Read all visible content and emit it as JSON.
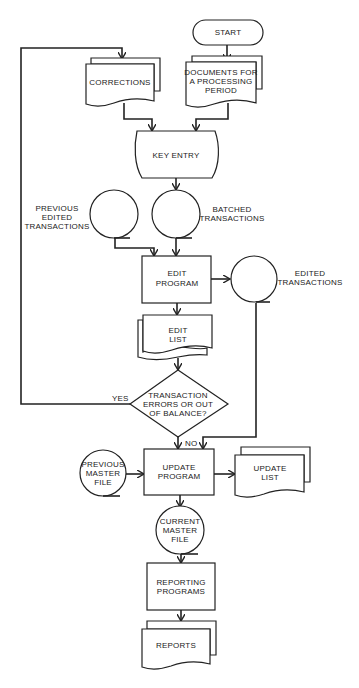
{
  "diagram": {
    "type": "flowchart",
    "colors": {
      "line": "#222222",
      "background": "#ffffff"
    },
    "nodes": {
      "start": {
        "shape": "terminator",
        "lines": [
          "START"
        ]
      },
      "documents": {
        "shape": "multi-document",
        "lines": [
          "DOCUMENTS FOR",
          "A PROCESSING",
          "PERIOD"
        ]
      },
      "corrections": {
        "shape": "multi-document",
        "lines": [
          "CORRECTIONS"
        ]
      },
      "key_entry": {
        "shape": "manual-operation",
        "lines": [
          "KEY ENTRY"
        ]
      },
      "previous_edited": {
        "shape": "magnetic-tape",
        "lines": [
          "PREVIOUS",
          "EDITED",
          "TRANSACTIONS"
        ]
      },
      "batched": {
        "shape": "magnetic-tape",
        "lines": [
          "BATCHED",
          "TRANSACTIONS"
        ]
      },
      "edit_program": {
        "shape": "process",
        "lines": [
          "EDIT",
          "PROGRAM"
        ]
      },
      "edited": {
        "shape": "magnetic-tape",
        "lines": [
          "EDITED",
          "TRANSACTIONS"
        ]
      },
      "edit_list": {
        "shape": "multi-document",
        "lines": [
          "EDIT",
          "LIST"
        ]
      },
      "decision": {
        "shape": "decision",
        "lines": [
          "TRANSACTION",
          "ERRORS OR OUT",
          "OF BALANCE?"
        ]
      },
      "previous_master": {
        "shape": "magnetic-tape",
        "lines": [
          "PREVIOUS",
          "MASTER",
          "FILE"
        ]
      },
      "update_program": {
        "shape": "process",
        "lines": [
          "UPDATE",
          "PROGRAM"
        ]
      },
      "update_list": {
        "shape": "multi-document",
        "lines": [
          "UPDATE",
          "LIST"
        ]
      },
      "current_master": {
        "shape": "magnetic-tape",
        "lines": [
          "CURRENT",
          "MASTER",
          "FILE"
        ]
      },
      "reporting_programs": {
        "shape": "process",
        "lines": [
          "REPORTING",
          "PROGRAMS"
        ]
      },
      "reports": {
        "shape": "multi-document",
        "lines": [
          "REPORTS"
        ]
      }
    },
    "edge_labels": {
      "yes": "YES",
      "no": "NO"
    },
    "edges": [
      [
        "start",
        "documents"
      ],
      [
        "documents",
        "key_entry"
      ],
      [
        "corrections",
        "key_entry"
      ],
      [
        "key_entry",
        "batched"
      ],
      [
        "batched",
        "edit_program"
      ],
      [
        "previous_edited",
        "edit_program"
      ],
      [
        "edit_program",
        "edited"
      ],
      [
        "edit_program",
        "edit_list"
      ],
      [
        "edit_list",
        "decision"
      ],
      [
        "decision",
        "corrections",
        "YES"
      ],
      [
        "decision",
        "update_program",
        "NO"
      ],
      [
        "edited",
        "update_program"
      ],
      [
        "previous_master",
        "update_program"
      ],
      [
        "update_program",
        "update_list"
      ],
      [
        "update_program",
        "current_master"
      ],
      [
        "current_master",
        "reporting_programs"
      ],
      [
        "reporting_programs",
        "reports"
      ]
    ]
  }
}
